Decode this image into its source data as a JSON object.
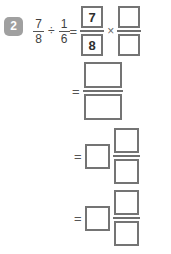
{
  "problem": {
    "number": "2",
    "expression": {
      "dividend": {
        "numerator": "7",
        "denominator": "8"
      },
      "divide_symbol": "÷",
      "divisor": {
        "numerator": "1",
        "denominator": "6"
      },
      "equals_symbol": "=",
      "times_symbol": "×"
    }
  },
  "step1": {
    "equals": "=",
    "reciprocal_multiply": {
      "left_fraction": {
        "numerator": "7",
        "denominator": "8"
      },
      "times": "×",
      "right_fraction": {
        "numerator": "",
        "denominator": ""
      }
    }
  },
  "step2": {
    "equals": "=",
    "fraction": {
      "numerator": "",
      "denominator": ""
    }
  },
  "step3": {
    "equals": "=",
    "mixed_number": {
      "whole": "",
      "numerator": "",
      "denominator": ""
    }
  },
  "step4": {
    "equals": "=",
    "mixed_number": {
      "whole": "",
      "numerator": "",
      "denominator": ""
    }
  },
  "colors": {
    "badge_background": "#a0a0a0",
    "badge_text": "#ffffff",
    "box_border": "#747474",
    "text": "#3a3a3a",
    "page_background": "#ffffff"
  }
}
